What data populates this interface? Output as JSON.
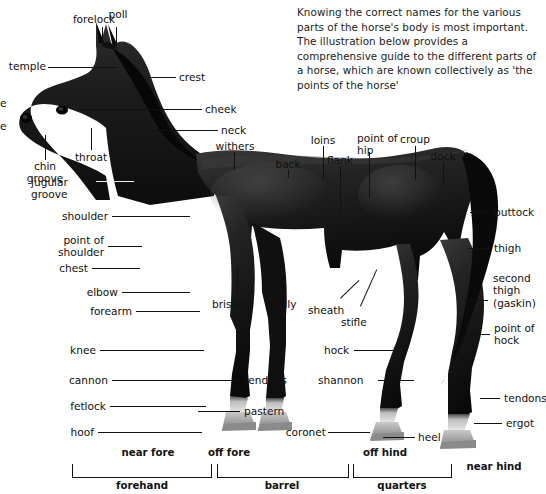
{
  "page": {
    "intro": "Knowing the correct names for the various parts of the horse's body is most important. The illustration below provides a comprehensive guide to the different parts of a horse, which are known collectively as 'the points of the horse'"
  },
  "colors": {
    "background": "#ffffff",
    "text": "#111111",
    "leader_dark": "#111111",
    "leader_light": "#f2f2f2",
    "coat_dark": "#151515",
    "coat_mid": "#2a2a2a",
    "sock_light": "#d8d8d8",
    "hoof": "#9a9a9a"
  },
  "labels": {
    "head": [
      {
        "id": "forelock",
        "text": "forelock"
      },
      {
        "id": "poll",
        "text": "poll"
      },
      {
        "id": "temple",
        "text": "temple"
      },
      {
        "id": "nose-partial",
        "text": "e"
      },
      {
        "id": "muzzle-partial",
        "text": "e"
      },
      {
        "id": "chin-groove",
        "text": "chin\ngroove"
      },
      {
        "id": "throat",
        "text": "throat"
      },
      {
        "id": "jugular-groove",
        "text": "jugular\ngroove"
      },
      {
        "id": "crest",
        "text": "crest"
      },
      {
        "id": "cheek",
        "text": "cheek"
      },
      {
        "id": "neck",
        "text": "neck"
      }
    ],
    "forehand": [
      {
        "id": "shoulder",
        "text": "shoulder"
      },
      {
        "id": "point-of-shoulder",
        "text": "point of\nshoulder"
      },
      {
        "id": "chest",
        "text": "chest"
      },
      {
        "id": "elbow",
        "text": "elbow"
      },
      {
        "id": "forearm",
        "text": "forearm"
      },
      {
        "id": "knee",
        "text": "knee"
      },
      {
        "id": "cannon",
        "text": "cannon"
      },
      {
        "id": "fetlock",
        "text": "fetlock"
      },
      {
        "id": "hoof",
        "text": "hoof"
      },
      {
        "id": "brisket",
        "text": "brisket"
      },
      {
        "id": "tendons-fore",
        "text": "tendons"
      },
      {
        "id": "pastern",
        "text": "pastern"
      }
    ],
    "topline": [
      {
        "id": "withers",
        "text": "withers"
      },
      {
        "id": "back",
        "text": "back"
      },
      {
        "id": "loins",
        "text": "loins"
      },
      {
        "id": "flank",
        "text": "flank"
      },
      {
        "id": "point-of-hip",
        "text": "point of\nhip"
      },
      {
        "id": "croup",
        "text": "croup"
      },
      {
        "id": "dock",
        "text": "dock"
      }
    ],
    "barrel": [
      {
        "id": "belly",
        "text": "belly"
      },
      {
        "id": "sheath",
        "text": "sheath"
      },
      {
        "id": "stifle",
        "text": "stifle"
      }
    ],
    "quarters": [
      {
        "id": "buttock",
        "text": "buttock"
      },
      {
        "id": "thigh",
        "text": "thigh"
      },
      {
        "id": "second-thigh",
        "text": "second\nthigh\n(gaskin)"
      },
      {
        "id": "hock",
        "text": "hock"
      },
      {
        "id": "point-of-hock",
        "text": "point of\nhock"
      },
      {
        "id": "shannon",
        "text": "shannon"
      },
      {
        "id": "tendons-hind",
        "text": "tendons"
      },
      {
        "id": "ergot",
        "text": "ergot"
      },
      {
        "id": "coronet",
        "text": "coronet"
      },
      {
        "id": "heel",
        "text": "heel"
      }
    ],
    "legs": [
      {
        "id": "near-fore",
        "text": "near fore"
      },
      {
        "id": "off-fore",
        "text": "off fore"
      },
      {
        "id": "off-hind",
        "text": "off hind"
      },
      {
        "id": "near-hind",
        "text": "near hind"
      }
    ],
    "regions": [
      {
        "id": "forehand",
        "text": "forehand"
      },
      {
        "id": "barrel",
        "text": "barrel"
      },
      {
        "id": "quarters",
        "text": "quarters"
      }
    ]
  }
}
